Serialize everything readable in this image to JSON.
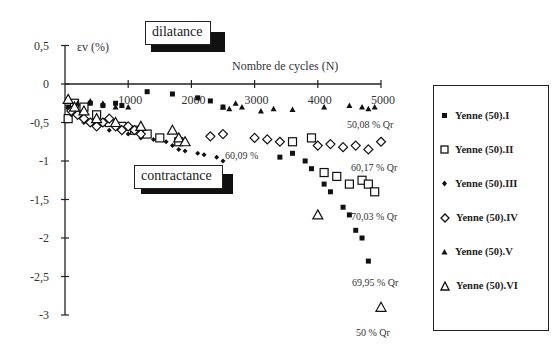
{
  "chart_data": {
    "type": "scatter",
    "title": "",
    "xlabel": "Nombre de cycles (N)",
    "ylabel": "εv (%)",
    "xlim": [
      0,
      5000
    ],
    "ylim": [
      -3,
      0.5
    ],
    "x_ticks": [
      1000,
      2000,
      3000,
      4000,
      5000
    ],
    "x_tick_labels": [
      "1000",
      "2000",
      "3000",
      "4000",
      "5000"
    ],
    "y_ticks": [
      0.5,
      0,
      -0.5,
      -1,
      -1.5,
      -2,
      -2.5,
      -3
    ],
    "y_tick_labels": [
      "0,5",
      "0",
      "-0,5",
      "-1",
      "-1,5",
      "-2",
      "-2,5",
      "-3"
    ],
    "grid": false,
    "legend_position": "right",
    "annotations": {
      "dilatance": "dilatance",
      "contractance": "contractance",
      "a1": "50,08 % Qr",
      "a2": "60,09 %",
      "a3": "60,17 % Qr",
      "a4": "70,03 % Qr",
      "a5": "69,95 % Qr",
      "a6": "50 % Qr"
    },
    "series": [
      {
        "name": "Yenne (50).I",
        "marker": "filled-square",
        "x": [
          50,
          100,
          200,
          400,
          600,
          800,
          900,
          1300,
          1700,
          2100,
          2300,
          2500,
          3400,
          3600,
          3800,
          3900,
          4100,
          4200,
          4400,
          4500,
          4600,
          4700,
          4800
        ],
        "y": [
          -0.3,
          -0.35,
          -0.4,
          -0.25,
          -0.28,
          -0.25,
          -0.28,
          -0.1,
          -0.13,
          -0.18,
          -0.22,
          -0.3,
          -0.95,
          -0.9,
          -1.0,
          -1.1,
          -1.3,
          -1.4,
          -1.6,
          -1.7,
          -1.9,
          -2.0,
          -2.3
        ]
      },
      {
        "name": "Yenne (50).II",
        "marker": "open-square",
        "x": [
          50,
          150,
          300,
          500,
          700,
          900,
          1100,
          1300,
          1500,
          1800,
          3600,
          3900,
          4100,
          4300,
          4500,
          4700,
          4800,
          4900
        ],
        "y": [
          -0.45,
          -0.25,
          -0.3,
          -0.4,
          -0.5,
          -0.55,
          -0.6,
          -0.65,
          -0.7,
          -0.75,
          -0.75,
          -0.7,
          -1.15,
          -1.2,
          -1.3,
          -1.25,
          -1.3,
          -1.4
        ]
      },
      {
        "name": "Yenne (50).III",
        "marker": "filled-diamond",
        "x": [
          100,
          300,
          500,
          700,
          900,
          1000,
          1200,
          1400,
          1600,
          1700,
          1800,
          1900,
          2100,
          2200,
          2400,
          2500
        ],
        "y": [
          -0.4,
          -0.5,
          -0.55,
          -0.6,
          -0.62,
          -0.65,
          -0.7,
          -0.72,
          -0.75,
          -0.8,
          -0.85,
          -0.87,
          -0.9,
          -0.92,
          -0.95,
          -1.0
        ]
      },
      {
        "name": "Yenne (50).IV",
        "marker": "open-diamond",
        "x": [
          100,
          200,
          300,
          400,
          500,
          600,
          700,
          800,
          900,
          1000,
          1100,
          1200,
          2300,
          2500,
          3000,
          3200,
          3400,
          4000,
          4200,
          4400,
          4600,
          4800,
          5000
        ],
        "y": [
          -0.35,
          -0.4,
          -0.45,
          -0.5,
          -0.55,
          -0.5,
          -0.45,
          -0.55,
          -0.6,
          -0.55,
          -0.6,
          -0.65,
          -0.68,
          -0.65,
          -0.7,
          -0.72,
          -0.75,
          -0.8,
          -0.78,
          -0.82,
          -0.8,
          -0.85,
          -0.75
        ]
      },
      {
        "name": "Yenne (50).V",
        "marker": "filled-triangle",
        "x": [
          50,
          200,
          400,
          600,
          800,
          1000,
          2500,
          2600,
          2700,
          2800,
          3100,
          3300,
          3600,
          4100,
          4500,
          4700,
          4800,
          4900
        ],
        "y": [
          -0.2,
          -0.25,
          -0.22,
          -0.25,
          -0.3,
          -0.3,
          -0.3,
          -0.32,
          -0.25,
          -0.3,
          -0.35,
          -0.32,
          -0.33,
          -0.3,
          -0.28,
          -0.3,
          -0.32,
          -0.3
        ]
      },
      {
        "name": "Yenne (50).VI",
        "marker": "open-triangle",
        "x": [
          50,
          150,
          300,
          500,
          800,
          1200,
          1700,
          1800,
          1900,
          4000,
          5000
        ],
        "y": [
          -0.2,
          -0.3,
          -0.35,
          -0.45,
          -0.5,
          -0.55,
          -0.6,
          -0.7,
          -0.75,
          -1.7,
          -2.9
        ]
      }
    ]
  },
  "legend": {
    "items": [
      {
        "label": "Yenne (50).I"
      },
      {
        "label": "Yenne (50).II"
      },
      {
        "label": "Yenne (50).III"
      },
      {
        "label": "Yenne (50).IV"
      },
      {
        "label": "Yenne (50).V"
      },
      {
        "label": "Yenne (50).VI"
      }
    ]
  }
}
